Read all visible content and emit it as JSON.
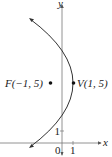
{
  "diagram": {
    "type": "parabola-graph",
    "equation_hint": "vertex V(1,5), focus F(-1,5), opens left",
    "axes": {
      "x_label": "x",
      "y_label": "y",
      "origin_label": "0",
      "x_tick_label": "1",
      "y_tick_label": "1"
    },
    "points": {
      "focus": {
        "label": "F(−1, 5)",
        "x": -1,
        "y": 5
      },
      "vertex": {
        "label": "V(1, 5)",
        "x": 1,
        "y": 5
      }
    },
    "colors": {
      "curve": "#333333",
      "axis": "#555555",
      "text": "#222222"
    }
  }
}
